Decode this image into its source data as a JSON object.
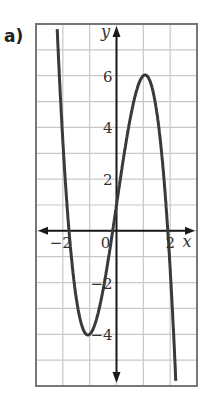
{
  "part_label": "a)",
  "chart_data": {
    "type": "line",
    "title": "",
    "xlabel": "x",
    "ylabel": "y",
    "xlim": [
      -3,
      3
    ],
    "ylim": [
      -6,
      8
    ],
    "grid": true,
    "grid_step": {
      "x": 1,
      "y": 1
    },
    "x_tick_labels": [
      {
        "value": -2,
        "label": "−2"
      },
      {
        "value": 2,
        "label": "2"
      }
    ],
    "y_tick_labels": [
      {
        "value": 6,
        "label": "6"
      },
      {
        "value": 4,
        "label": "4"
      },
      {
        "value": 2,
        "label": "2"
      },
      {
        "value": -2,
        "label": "−2"
      },
      {
        "value": -4,
        "label": "−4"
      }
    ],
    "origin_label": "0",
    "series": [
      {
        "name": "cubic",
        "approx_equation": "y = -2.08x^3 + 7.08x + 1",
        "key_points": [
          {
            "x": -2.22,
            "y": 8
          },
          {
            "x": -1.8,
            "y": 0
          },
          {
            "x": -1,
            "y": -4,
            "note": "local minimum"
          },
          {
            "x": -0.14,
            "y": 0
          },
          {
            "x": 0,
            "y": 1
          },
          {
            "x": 1,
            "y": 6,
            "note": "local maximum"
          },
          {
            "x": 1.9,
            "y": 0
          },
          {
            "x": 2.22,
            "y": -6
          }
        ]
      }
    ],
    "colors": {
      "curve": "#3a3a3a",
      "axes": "#1a1a1a",
      "grid": "#c8c8c8",
      "frame": "#777777"
    }
  }
}
